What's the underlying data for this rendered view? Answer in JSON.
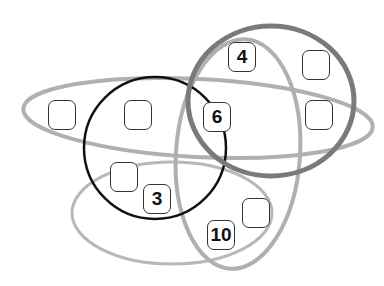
{
  "diagram": {
    "type": "puzzle-venn",
    "shapes": [
      {
        "name": "horizontal-ellipse",
        "color": "#b0b0b0"
      },
      {
        "name": "black-circle",
        "color": "#111111"
      },
      {
        "name": "vertical-ellipse",
        "color": "#b0b0b0"
      },
      {
        "name": "dark-gray-circle",
        "color": "#7a7a7a"
      },
      {
        "name": "lower-ellipse",
        "color": "#b8b8b8"
      }
    ],
    "boxes": [
      {
        "id": "box-left-1",
        "value": ""
      },
      {
        "id": "box-left-2",
        "value": ""
      },
      {
        "id": "box-4",
        "value": "4"
      },
      {
        "id": "box-top-right",
        "value": ""
      },
      {
        "id": "box-6",
        "value": "6"
      },
      {
        "id": "box-mid-right",
        "value": ""
      },
      {
        "id": "box-lower-left",
        "value": ""
      },
      {
        "id": "box-3",
        "value": "3"
      },
      {
        "id": "box-lower-right",
        "value": ""
      },
      {
        "id": "box-10",
        "value": "10"
      }
    ]
  }
}
